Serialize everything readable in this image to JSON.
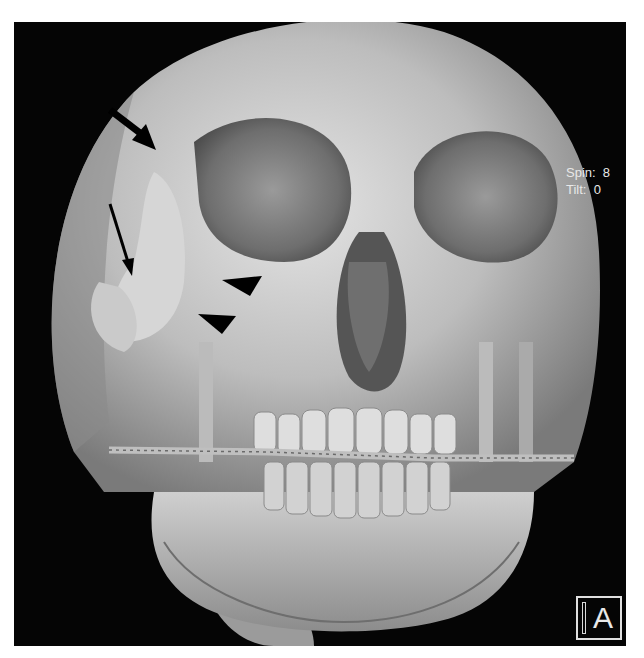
{
  "image": {
    "subject": "3D CT volume rendering of skull, frontal view",
    "background_color": "#050505",
    "bone_color": "#c8c8c8"
  },
  "overlay": {
    "spin_label": "Spin:  8",
    "tilt_label": "Tilt:  0",
    "orientation_marker": "A"
  },
  "annotations": [
    {
      "type": "thick-arrow",
      "target": "frontozygomatic suture"
    },
    {
      "type": "thin-arrow",
      "target": "zygomatic arch"
    },
    {
      "type": "arrowhead",
      "target": "orbital floor / maxilla"
    },
    {
      "type": "arrowhead",
      "target": "maxillary wall"
    }
  ]
}
